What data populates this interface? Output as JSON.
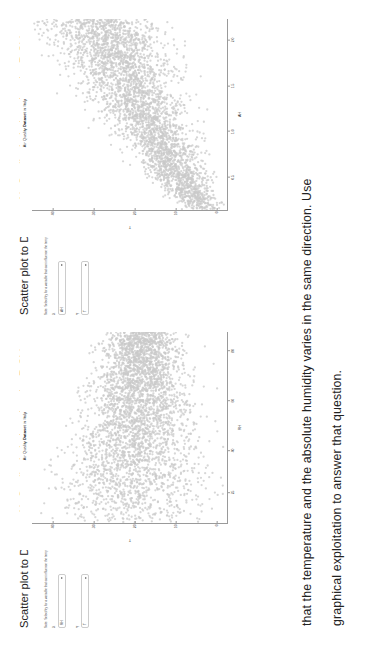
{
  "question": {
    "lines": [
      "that the temperature and the absolute humidity varies in  the  same  direction.  Use",
      "graphical exploitation to answer that question."
    ]
  },
  "panels": [
    {
      "heading": "Scatter plot to Dataset Air Quality in Italy using the R Shiny",
      "note": "Note: Select/try for a variable that can influence the temperature (T) in Y",
      "controls": [
        {
          "label": "X",
          "value": "RH"
        },
        {
          "label": "Y",
          "value": "T"
        }
      ],
      "plot": {
        "title_prefix": "Air Quality ",
        "title_bold": "Dataset",
        "title_suffix": " in Italy",
        "xlabel": "RH",
        "ylabel": "T",
        "xticks": [
          "25",
          "40",
          "60",
          "80"
        ],
        "yticks": [
          "0",
          "10",
          "20",
          "30",
          "40"
        ]
      }
    },
    {
      "heading": "Scatter plot to Dataset Air Quality in Italy using the R Shiny",
      "note": "Note: Select/try for a variable that can influence the temperature (T) in Y",
      "controls": [
        {
          "label": "X",
          "value": "AH"
        },
        {
          "label": "Y",
          "value": "T"
        }
      ],
      "plot": {
        "title_prefix": "Air Quality ",
        "title_bold": "Dataset",
        "title_suffix": " in Italy",
        "xlabel": "AH",
        "ylabel": "T",
        "xticks": [
          "0.5",
          "1.0",
          "1.5",
          "2.0"
        ],
        "yticks": [
          "0",
          "10",
          "20",
          "30",
          "40"
        ]
      }
    }
  ],
  "chart_data": [
    {
      "type": "scatter",
      "title": "Air Quality Dataset in Italy",
      "xlabel": "RH",
      "ylabel": "T",
      "xlim": [
        8,
        90
      ],
      "ylim": [
        -2,
        45
      ],
      "xticks": [
        25,
        40,
        60,
        80
      ],
      "yticks": [
        0,
        10,
        20,
        30,
        40
      ],
      "grid": false,
      "point_color": "#c9c9c9",
      "n_points": 9357,
      "description": "Dense cloud of points; temperature T decreasing slightly as relative humidity RH increases, wedge narrowing toward high RH."
    },
    {
      "type": "scatter",
      "title": "Air Quality Dataset in Italy",
      "xlabel": "AH",
      "ylabel": "T",
      "xlim": [
        0.15,
        2.25
      ],
      "ylim": [
        -2,
        45
      ],
      "xticks": [
        0.5,
        1.0,
        1.5,
        2.0
      ],
      "yticks": [
        0,
        10,
        20,
        30,
        40
      ],
      "grid": false,
      "point_color": "#c9c9c9",
      "n_points": 9357,
      "description": "Dense cloud of points rising from lower-left to upper-right; temperature T increases with absolute humidity AH (positive relation)."
    }
  ]
}
